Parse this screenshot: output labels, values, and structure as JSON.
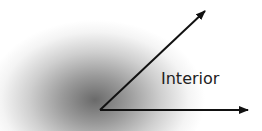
{
  "diagram": {
    "type": "angle",
    "label": "Interior",
    "vertex": [
      100,
      110
    ],
    "rays": [
      {
        "name": "upper-ray",
        "end": [
          205,
          11
        ]
      },
      {
        "name": "lower-ray",
        "end": [
          248,
          110
        ]
      }
    ],
    "colors": {
      "stroke": "#111111",
      "label": "#222222",
      "shadow": "#6a6a6a"
    }
  }
}
